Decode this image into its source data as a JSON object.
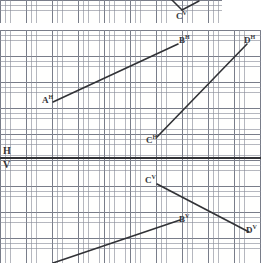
{
  "figure": {
    "width": 261,
    "height": 263,
    "background_color": "#ffffff",
    "ink_color": "#15161c",
    "grid_minor_color": "#787d8c",
    "grid_major_color": "#3c4150",
    "grid_minor_spacing_px": 5.2,
    "grid_major_spacing_px": 26
  },
  "top_panel": {
    "name": "partial-figure-above",
    "x": 0,
    "y": 0,
    "width": 222,
    "height": 23,
    "vertex_label": "C",
    "vertex_superscript": "V",
    "vertex_label_text": "C",
    "vertex_x": 182,
    "vertex_y": 10,
    "label_x": 176,
    "label_y": 12,
    "strokes": [
      {
        "name": "left-ray",
        "x1": 166,
        "y1": -6,
        "x2": 182,
        "y2": 10
      },
      {
        "name": "right-ray",
        "x1": 182,
        "y1": 10,
        "x2": 199,
        "y2": 1
      }
    ]
  },
  "main_panel": {
    "name": "main-projection-figure",
    "x": 0,
    "y": 30,
    "width": 261,
    "height": 233,
    "ground_line": {
      "name": "ground-line-hv",
      "y": 128,
      "x1": 0,
      "x2": 261,
      "h_label": "H",
      "v_label": "V",
      "h_label_x": 3,
      "h_label_y": 116,
      "v_label_x": 3,
      "v_label_y": 130
    },
    "points": [
      {
        "id": "A_H",
        "letter": "A",
        "projection": "H",
        "x": 53,
        "y": 72,
        "label_x": 42,
        "label_y": 66
      },
      {
        "id": "B_H",
        "letter": "B",
        "projection": "H",
        "x": 178,
        "y": 14,
        "label_x": 179,
        "label_y": 6
      },
      {
        "id": "C_H",
        "letter": "C",
        "projection": "H",
        "x": 157,
        "y": 107,
        "label_x": 146,
        "label_y": 106
      },
      {
        "id": "D_H",
        "letter": "D",
        "projection": "H",
        "x": 247,
        "y": 14,
        "label_x": 244,
        "label_y": 6
      },
      {
        "id": "C_V",
        "letter": "C",
        "projection": "V",
        "x": 157,
        "y": 154,
        "label_x": 145,
        "label_y": 146
      },
      {
        "id": "B_V",
        "letter": "B",
        "projection": "V",
        "x": 180,
        "y": 190,
        "label_x": 179,
        "label_y": 185
      },
      {
        "id": "D_V",
        "letter": "D",
        "projection": "V",
        "x": 249,
        "y": 202,
        "label_x": 246,
        "label_y": 196
      }
    ],
    "segments": [
      {
        "name": "segment-AH-BH",
        "from": "A_H",
        "to": "B_H",
        "x1": 53,
        "y1": 72,
        "x2": 178,
        "y2": 14
      },
      {
        "name": "segment-CH-DH",
        "from": "C_H",
        "to": "D_H",
        "x1": 157,
        "y1": 107,
        "x2": 247,
        "y2": 14
      },
      {
        "name": "segment-CV-DV",
        "from": "C_V",
        "to": "D_V",
        "x1": 157,
        "y1": 154,
        "x2": 249,
        "y2": 202
      },
      {
        "name": "segment-AV-BV",
        "from": "A_V",
        "to": "B_V",
        "x1": 53,
        "y1": 233,
        "x2": 180,
        "y2": 190
      }
    ]
  }
}
